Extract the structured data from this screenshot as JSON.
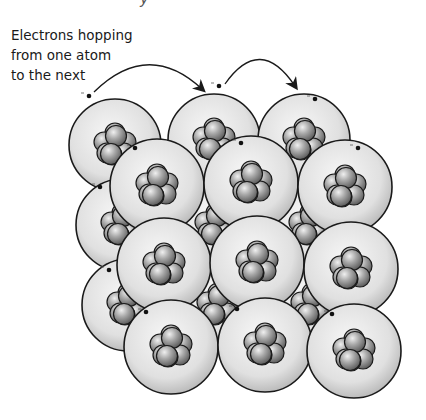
{
  "title_fragment": "y",
  "caption": {
    "lines": [
      "Electrons hopping",
      "from one atom",
      "to the next"
    ]
  },
  "diagram": {
    "arrows": [
      {
        "from": [
          94,
          92
        ],
        "to": [
          202,
          89
        ]
      },
      {
        "from": [
          225,
          84
        ],
        "to": [
          295,
          86
        ]
      }
    ],
    "back_atoms": [
      {
        "cx": 115,
        "cy": 145,
        "r": 46
      },
      {
        "cx": 214,
        "cy": 140,
        "r": 46
      },
      {
        "cx": 304,
        "cy": 140,
        "r": 46
      },
      {
        "cx": 122,
        "cy": 225,
        "r": 46
      },
      {
        "cx": 216,
        "cy": 225,
        "r": 46
      },
      {
        "cx": 310,
        "cy": 225,
        "r": 46
      },
      {
        "cx": 128,
        "cy": 305,
        "r": 46
      },
      {
        "cx": 218,
        "cy": 305,
        "r": 46
      },
      {
        "cx": 312,
        "cy": 305,
        "r": 46
      }
    ],
    "front_atoms": [
      {
        "cx": 157,
        "cy": 186,
        "r": 47
      },
      {
        "cx": 251,
        "cy": 183,
        "r": 47
      },
      {
        "cx": 345,
        "cy": 187,
        "r": 47
      },
      {
        "cx": 164,
        "cy": 265,
        "r": 47
      },
      {
        "cx": 257,
        "cy": 263,
        "r": 47
      },
      {
        "cx": 351,
        "cy": 269,
        "r": 47
      },
      {
        "cx": 171,
        "cy": 347,
        "r": 47
      },
      {
        "cx": 265,
        "cy": 345,
        "r": 47
      },
      {
        "cx": 354,
        "cy": 351,
        "r": 47
      }
    ],
    "electrons": [
      {
        "x": 89,
        "y": 96
      },
      {
        "x": 219,
        "y": 86
      },
      {
        "x": 315,
        "y": 99
      },
      {
        "x": 135,
        "y": 148
      },
      {
        "x": 241,
        "y": 143
      },
      {
        "x": 358,
        "y": 148
      },
      {
        "x": 100,
        "y": 187
      },
      {
        "x": 109,
        "y": 270
      },
      {
        "x": 146,
        "y": 312
      },
      {
        "x": 237,
        "y": 309
      },
      {
        "x": 332,
        "y": 314
      }
    ],
    "colors": {
      "atom_fill_center": "#f4f4f4",
      "atom_fill_edge": "#bdbdbd",
      "nucleon_light": "#e8e8e8",
      "nucleon_dark": "#6e6e6e",
      "outline": "#1a1a1a"
    }
  }
}
